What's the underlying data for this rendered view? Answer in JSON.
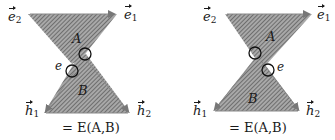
{
  "diagrams": [
    {
      "id": "left",
      "labels": {
        "e2": {
          "base": "e",
          "sub": "2"
        },
        "e1": {
          "base": "e",
          "sub": "1"
        },
        "h1": {
          "base": "h",
          "sub": "1"
        },
        "h2": {
          "base": "h",
          "sub": "2"
        },
        "region_top": "A",
        "region_bottom": "B",
        "edge": "e"
      },
      "caption": "= E(A,B)"
    },
    {
      "id": "right",
      "labels": {
        "e2": {
          "base": "e",
          "sub": "2"
        },
        "e1": {
          "base": "e",
          "sub": "1"
        },
        "h1": {
          "base": "h",
          "sub": "1"
        },
        "h2": {
          "base": "h",
          "sub": "2"
        },
        "region_top": "A",
        "region_bottom": "B",
        "edge": "e"
      },
      "caption": "= E(A,B)"
    }
  ],
  "colors": {
    "fill": "#8c8c8c",
    "hatch": "#5a5a5a",
    "stroke": "#333333",
    "circle": "#111111"
  }
}
